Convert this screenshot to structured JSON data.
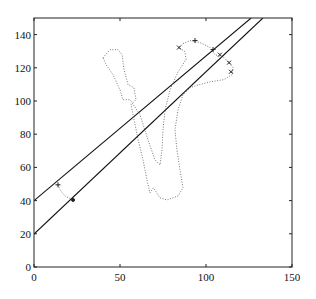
{
  "chart_data": {
    "type": "line",
    "title": "",
    "xlabel": "",
    "ylabel": "",
    "xlim": [
      0,
      150
    ],
    "ylim": [
      0,
      150
    ],
    "grid": false,
    "legend": null,
    "xticks": [
      0,
      50,
      100,
      150
    ],
    "yticks": [
      0,
      20,
      40,
      60,
      80,
      100,
      120,
      140
    ],
    "xtick_labels": [
      "0",
      "50",
      "100",
      "150"
    ],
    "ytick_labels": [
      "0",
      "20",
      "40",
      "60",
      "80",
      "100",
      "120",
      "140"
    ],
    "series": [
      {
        "name": "line-upper",
        "style": "solid",
        "color": "#111111",
        "x": [
          0,
          126.2
        ],
        "y": [
          40,
          150
        ]
      },
      {
        "name": "line-lower",
        "style": "solid",
        "color": "#111111",
        "x": [
          0,
          133.1
        ],
        "y": [
          19.9,
          150
        ]
      },
      {
        "name": "contour-hook",
        "style": "dotted",
        "color": "#777777",
        "x": [
          13.95,
          15.1,
          18.0,
          22.7
        ],
        "y": [
          49.5,
          46.5,
          42.8,
          40.4
        ]
      },
      {
        "name": "contour-main",
        "style": "dotted",
        "color": "#777777",
        "x": [
          40.1,
          44.2,
          48.8,
          51.2,
          52.3,
          54.7,
          58.1,
          59.3,
          56.4,
          57.6,
          60.5,
          63.4,
          65.7,
          67.4,
          69.4,
          73.3,
          77.3,
          83.7,
          86.6,
          84.9,
          83.1,
          82.0,
          83.7,
          86.6,
          90.7,
          95.9,
          102.9,
          110.5,
          115.1,
          115.7,
          113.4,
          110.5,
          105.2,
          102.3,
          96.5,
          90.7,
          86.6,
          84.3,
          87.8,
          88.4,
          83.7,
          79.1,
          76.2,
          75.0,
          74.4,
          73.3,
          70.3,
          66.3,
          61.6,
          55.8,
          51.7,
          49.99,
          45.9,
          41.9,
          40.1
        ],
        "y": [
          126.1,
          130.9,
          130.9,
          127.9,
          118.8,
          109.8,
          108.0,
          100.8,
          97.8,
          91.7,
          76.7,
          64.6,
          52.5,
          44.7,
          47.7,
          41.6,
          40.4,
          42.8,
          47.7,
          58.5,
          70.6,
          82.7,
          94.8,
          103.8,
          108.0,
          109.8,
          111.6,
          112.9,
          115.9,
          120.1,
          123.1,
          126.1,
          127.9,
          132.2,
          135.2,
          136.4,
          134.6,
          132.2,
          129.7,
          124.9,
          117.6,
          106.8,
          94.8,
          82.7,
          70.6,
          61.5,
          64.6,
          76.7,
          91.7,
          100.8,
          100.8,
          106.8,
          115.9,
          121.9,
          126.1
        ]
      }
    ],
    "markers": [
      {
        "symbol": "+",
        "x": 13.95,
        "y": 49.5
      },
      {
        "symbol": "dot",
        "x": 22.7,
        "y": 40.4
      },
      {
        "symbol": "x",
        "x": 84.3,
        "y": 132.2
      },
      {
        "symbol": "+",
        "x": 93.6,
        "y": 136.4
      },
      {
        "symbol": "+",
        "x": 104.1,
        "y": 131.0
      },
      {
        "symbol": "x",
        "x": 108.1,
        "y": 127.9
      },
      {
        "symbol": "x",
        "x": 113.4,
        "y": 123.1
      },
      {
        "symbol": "x",
        "x": 114.5,
        "y": 117.6
      }
    ]
  }
}
